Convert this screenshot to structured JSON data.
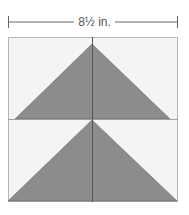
{
  "diagram": {
    "dimension_label": "8½ in.",
    "colors": {
      "triangle_fill": "#8c8c8c",
      "background_fill": "#f4f4f4",
      "border": "#b5b5b5",
      "line": "#555555"
    },
    "blocks": [
      {
        "name": "top-block",
        "shape": "triangle"
      },
      {
        "name": "bottom-block",
        "shape": "triangle"
      }
    ]
  }
}
